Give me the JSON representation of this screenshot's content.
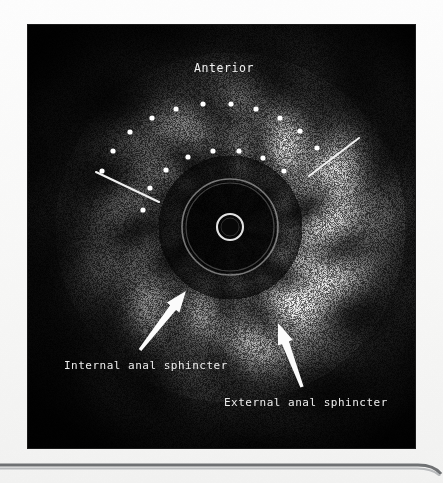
{
  "figure": {
    "modality": "endoanal-ultrasound",
    "frame": {
      "x": 28,
      "y": 25,
      "width": 387,
      "height": 423
    },
    "background_color": "#f7f7f6",
    "scan_background_color": "#050505",
    "annotation_color": "#ffffff"
  },
  "annotations": {
    "orientation_label": "Anterior",
    "internal_sphincter_label": "Internal anal sphincter",
    "external_sphincter_label": "External anal sphincter"
  },
  "labels": [
    {
      "name": "anterior",
      "text": "Anterior",
      "x": 196,
      "y": 47,
      "anchor": "middle",
      "size": 11.5
    },
    {
      "name": "internal-anal-sphincter",
      "text": "Internal anal sphincter",
      "x": 36,
      "y": 344,
      "anchor": "start",
      "size": 11
    },
    {
      "name": "external-anal-sphincter",
      "text": "External anal sphincter",
      "x": 196,
      "y": 381,
      "anchor": "start",
      "size": 11
    }
  ],
  "pointer_lines": [
    {
      "name": "left-pointer-line",
      "x1": 68,
      "y1": 147,
      "x2": 131,
      "y2": 177
    },
    {
      "name": "right-pointer-line",
      "x1": 281,
      "y1": 151,
      "x2": 331,
      "y2": 113
    }
  ],
  "arrows": [
    {
      "name": "internal-sphincter-arrow",
      "tail_x": 112,
      "tail_y": 325,
      "tip_x": 158,
      "tip_y": 266,
      "width": 7.5,
      "head_len": 21,
      "head_w": 16
    },
    {
      "name": "external-sphincter-arrow",
      "tail_x": 274,
      "tail_y": 362,
      "tip_x": 250,
      "tip_y": 298,
      "width": 7.5,
      "head_len": 21,
      "head_w": 16
    }
  ],
  "marker_dots": {
    "radius": 2.6,
    "outer_arc": [
      {
        "x": 74,
        "y": 146
      },
      {
        "x": 85,
        "y": 126
      },
      {
        "x": 102,
        "y": 107
      },
      {
        "x": 124,
        "y": 93
      },
      {
        "x": 148,
        "y": 84
      },
      {
        "x": 175,
        "y": 79
      },
      {
        "x": 203,
        "y": 79
      },
      {
        "x": 228,
        "y": 84
      },
      {
        "x": 252,
        "y": 93
      },
      {
        "x": 272,
        "y": 106
      },
      {
        "x": 289,
        "y": 123
      }
    ],
    "inner_arc": [
      {
        "x": 115,
        "y": 185
      },
      {
        "x": 122,
        "y": 163
      },
      {
        "x": 138,
        "y": 145
      },
      {
        "x": 160,
        "y": 132
      },
      {
        "x": 185,
        "y": 126
      },
      {
        "x": 211,
        "y": 126
      },
      {
        "x": 235,
        "y": 133
      },
      {
        "x": 256,
        "y": 146
      }
    ]
  },
  "transducer": {
    "center_x": 202,
    "center_y": 202,
    "inner_ring_radius": 13,
    "inner_ring_radius2": 9,
    "outer_ring_radius": 48,
    "outer_ring_radius2": 44
  },
  "anatomy_rings": [
    {
      "name": "internal-anal-sphincter-ring",
      "radius": 62,
      "brightness": 0.18
    },
    {
      "name": "external-anal-sphincter-ring",
      "radius": 104,
      "brightness": 0.52
    },
    {
      "name": "outer-tissue-ring",
      "radius": 140,
      "brightness": 0.3
    }
  ]
}
